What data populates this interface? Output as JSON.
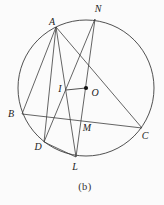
{
  "figure": {
    "caption": "(b)",
    "background_color": "#fbfbfb",
    "stroke_color": "#3d3d3d",
    "label_color": "#222222",
    "circle": {
      "cx": 86,
      "cy": 88,
      "r": 68
    },
    "center_dot": {
      "point": "O",
      "r": 2.1,
      "fill": "#111111"
    },
    "points": {
      "A": {
        "x": 56,
        "y": 27
      },
      "N": {
        "x": 95,
        "y": 19
      },
      "B": {
        "x": 22,
        "y": 114
      },
      "C": {
        "x": 142,
        "y": 128
      },
      "D": {
        "x": 44,
        "y": 142
      },
      "L": {
        "x": 76,
        "y": 157
      },
      "I": {
        "x": 66,
        "y": 90
      },
      "M": {
        "x": 81,
        "y": 121
      },
      "O": {
        "x": 86,
        "y": 88
      }
    },
    "chords": [
      [
        "A",
        "B"
      ],
      [
        "A",
        "C"
      ],
      [
        "A",
        "D"
      ],
      [
        "A",
        "L"
      ],
      [
        "B",
        "C"
      ],
      [
        "N",
        "D"
      ],
      [
        "N",
        "L"
      ],
      [
        "D",
        "L"
      ]
    ],
    "segments": [
      [
        "I",
        "O"
      ]
    ],
    "labels": [
      {
        "text": "A",
        "x": 52,
        "y": 25
      },
      {
        "text": "N",
        "x": 98,
        "y": 12
      },
      {
        "text": "B",
        "x": 11,
        "y": 117
      },
      {
        "text": "C",
        "x": 145,
        "y": 139
      },
      {
        "text": "D",
        "x": 38,
        "y": 150
      },
      {
        "text": "L",
        "x": 75,
        "y": 170
      },
      {
        "text": "M",
        "x": 87,
        "y": 131
      },
      {
        "text": "I",
        "x": 60,
        "y": 92
      },
      {
        "text": "O",
        "x": 95,
        "y": 96
      }
    ]
  }
}
